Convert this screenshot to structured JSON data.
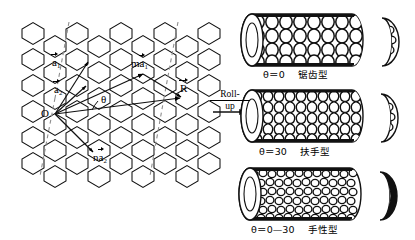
{
  "figure": {
    "title_semantic": "carbon-nanotube-chirality-rollup-diagram",
    "background": "#ffffff",
    "ink": "#000000",
    "dash_color": "#8a8a8a"
  },
  "lattice": {
    "name": "graphene-hexagonal-lattice",
    "origin_label": "O",
    "angle_label": "θ",
    "vectors": [
      {
        "id": "a1",
        "base": "a",
        "sub": "1",
        "prefix": "",
        "label": "a⃗1"
      },
      {
        "id": "a2",
        "base": "a",
        "sub": "2",
        "prefix": "",
        "label": "a⃗2"
      },
      {
        "id": "ma1",
        "base": "a",
        "sub": "1",
        "prefix": "m",
        "label": "ma⃗1"
      },
      {
        "id": "na2",
        "base": "a",
        "sub": "2",
        "prefix": "n",
        "label": "na⃗2"
      },
      {
        "id": "R",
        "base": "R",
        "sub": "",
        "prefix": "",
        "label": "R⃗"
      }
    ]
  },
  "rollup": {
    "line1": "Roll-",
    "line2": "up",
    "arrow": "rightwards-arrow"
  },
  "tubes": [
    {
      "id": "zigzag",
      "caption_angle": "θ＝0",
      "caption_type": "锯齿型",
      "caption_full": "θ＝0  锯齿型",
      "tube_name": "zigzag-nanotube",
      "cross_section_name": "zigzag-cross-section"
    },
    {
      "id": "armchair",
      "caption_angle": "θ＝30",
      "caption_type": "扶手型",
      "caption_full": "θ＝30  扶手型",
      "tube_name": "armchair-nanotube",
      "cross_section_name": "armchair-cross-section"
    },
    {
      "id": "chiral",
      "caption_angle": "θ＝0—30",
      "caption_type": "手性型",
      "caption_full": "θ＝0—30  手性型",
      "tube_name": "chiral-nanotube",
      "cross_section_name": "chiral-cross-section"
    }
  ]
}
